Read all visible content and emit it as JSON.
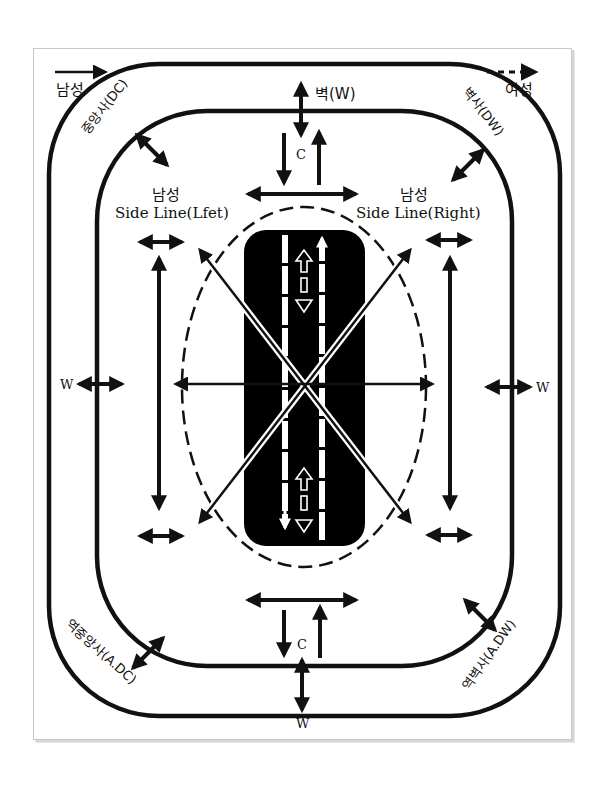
{
  "legend": {
    "men": {
      "label": "남성",
      "line_style": "solid"
    },
    "women": {
      "label": "여성",
      "line_style": "dashed"
    }
  },
  "labels": {
    "top_wall": "벽(W)",
    "top_center": "C",
    "bottom_center": "C",
    "bottom_wall": "W",
    "left_wall": "W",
    "right_wall": "W",
    "diag_center": "중앙사(DC)",
    "diag_wall": "벽사(DW)",
    "diag_anti_center": "역중앙사(A.DC)",
    "diag_anti_wall": "역벽사(A.DW)",
    "side_left_title": "남성",
    "side_left_sub": "Side Line(Lfet)",
    "side_right_title": "남성",
    "side_right_sub": "Side Line(Right)"
  },
  "colors": {
    "ink": "#111111",
    "background": "#ffffff",
    "center_block": "#000000",
    "center_lines": "#ffffff"
  }
}
